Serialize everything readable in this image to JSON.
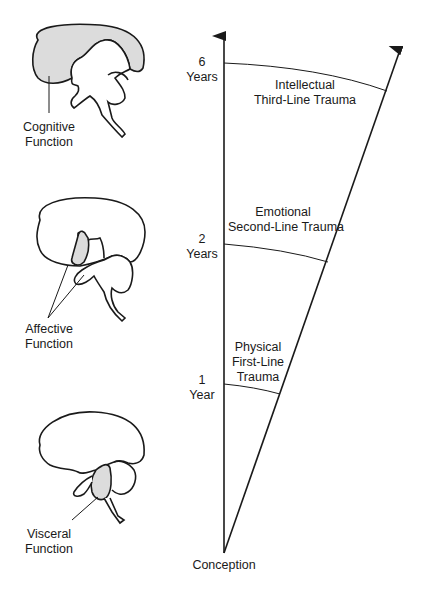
{
  "axis": {
    "origin_label": "Conception",
    "ticks": [
      {
        "number": "1",
        "unit": "Year"
      },
      {
        "number": "2",
        "unit": "Years"
      },
      {
        "number": "6",
        "unit": "Years"
      }
    ]
  },
  "trauma_bands": [
    {
      "line1": "Physical",
      "line2": "First-Line",
      "line3": "Trauma"
    },
    {
      "line1": "Emotional",
      "line2": "Second-Line Trauma"
    },
    {
      "line1": "Intellectual",
      "line2": "Third-Line Trauma"
    }
  ],
  "brain_functions": [
    {
      "line1": "Cognitive",
      "line2": "Function"
    },
    {
      "line1": "Affective",
      "line2": "Function"
    },
    {
      "line1": "Visceral",
      "line2": "Function"
    }
  ],
  "colors": {
    "line": "#1a1a1a",
    "highlight_fill": "#dcdcdc"
  }
}
